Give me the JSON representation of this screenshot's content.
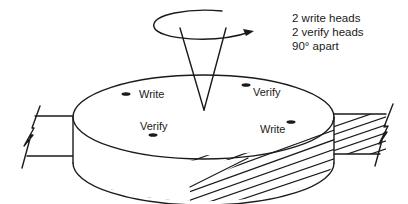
{
  "figure": {
    "note_lines": [
      "2 write heads",
      "2 verify heads",
      "90° apart"
    ],
    "heads": [
      {
        "label": "Write",
        "position": "top-left"
      },
      {
        "label": "Verify",
        "position": "top-right"
      },
      {
        "label": "Verify",
        "position": "bottom-left"
      },
      {
        "label": "Write",
        "position": "bottom-right"
      }
    ],
    "rotation_indicator": "rotation-arrow",
    "colors": {
      "line": "#1a1a1a",
      "background": "#ffffff"
    }
  }
}
